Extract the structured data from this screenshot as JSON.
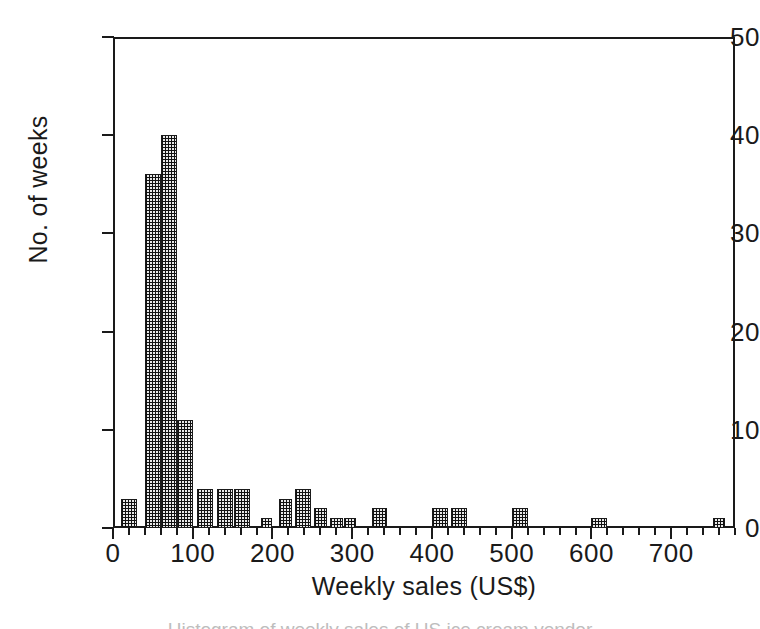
{
  "figure": {
    "background": "#ffffff",
    "ink_color": "#1a1a1a",
    "bar_fill_color": "#3a3a3a",
    "caption_partial": "Histogram of weekly sales of US ice cream vendor"
  },
  "chart_data": {
    "type": "bar",
    "title": "",
    "xlabel": "Weekly sales (US$)",
    "ylabel": "No. of weeks",
    "xlim": [
      0,
      780
    ],
    "ylim": [
      0,
      50
    ],
    "grid": false,
    "legend": false,
    "bin_width": 20,
    "x_major_ticks": [
      0,
      100,
      200,
      300,
      400,
      500,
      600,
      700
    ],
    "x_major_tick_labels": [
      "0",
      "100",
      "200",
      "300",
      "400",
      "500",
      "600",
      "700"
    ],
    "x_minor_tick_step": 20,
    "y_major_ticks": [
      0,
      10,
      20,
      30,
      40,
      50
    ],
    "y_major_tick_labels": [
      "0",
      "10",
      "20",
      "30",
      "40",
      "50"
    ],
    "bins": [
      {
        "left": 10,
        "right": 30,
        "value": 3
      },
      {
        "left": 40,
        "right": 60,
        "value": 36
      },
      {
        "left": 60,
        "right": 80,
        "value": 40
      },
      {
        "left": 80,
        "right": 100,
        "value": 11
      },
      {
        "left": 105,
        "right": 125,
        "value": 4
      },
      {
        "left": 130,
        "right": 150,
        "value": 4
      },
      {
        "left": 152,
        "right": 172,
        "value": 4
      },
      {
        "left": 185,
        "right": 200,
        "value": 1
      },
      {
        "left": 208,
        "right": 225,
        "value": 3
      },
      {
        "left": 228,
        "right": 248,
        "value": 4
      },
      {
        "left": 252,
        "right": 268,
        "value": 2
      },
      {
        "left": 272,
        "right": 288,
        "value": 1
      },
      {
        "left": 290,
        "right": 305,
        "value": 1
      },
      {
        "left": 325,
        "right": 343,
        "value": 2
      },
      {
        "left": 400,
        "right": 420,
        "value": 2
      },
      {
        "left": 424,
        "right": 444,
        "value": 2
      },
      {
        "left": 500,
        "right": 520,
        "value": 2
      },
      {
        "left": 600,
        "right": 620,
        "value": 1
      },
      {
        "left": 752,
        "right": 768,
        "value": 1
      }
    ],
    "categories": [
      "10-30",
      "40-60",
      "60-80",
      "80-100",
      "105-125",
      "130-150",
      "152-172",
      "185-200",
      "208-225",
      "228-248",
      "252-268",
      "272-288",
      "290-305",
      "325-343",
      "400-420",
      "424-444",
      "500-520",
      "600-620",
      "752-768"
    ],
    "values": [
      3,
      36,
      40,
      11,
      4,
      4,
      4,
      1,
      3,
      4,
      2,
      1,
      1,
      2,
      2,
      2,
      2,
      1,
      1
    ]
  }
}
